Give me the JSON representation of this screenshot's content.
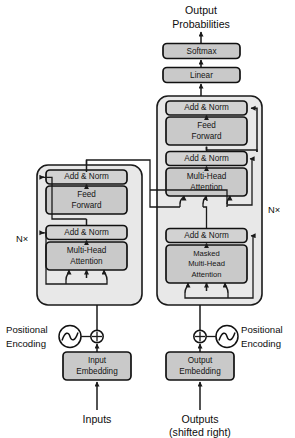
{
  "figure": {
    "top_label_line1": "Output",
    "top_label_line2": "Probabilities"
  },
  "output_head": {
    "softmax": "Softmax",
    "linear": "Linear"
  },
  "encoder": {
    "repeat_label": "N×",
    "blocks": [
      {
        "name": "add-norm-upper",
        "label": "Add & Norm"
      },
      {
        "name": "feed-forward",
        "label_line1": "Feed",
        "label_line2": "Forward"
      },
      {
        "name": "add-norm-lower",
        "label": "Add & Norm"
      },
      {
        "name": "multi-head-attention",
        "label_line1": "Multi-Head",
        "label_line2": "Attention"
      }
    ],
    "embedding_line1": "Input",
    "embedding_line2": "Embedding",
    "positional_line1": "Positional",
    "positional_line2": "Encoding",
    "input_label": "Inputs",
    "add_symbol": "⊕"
  },
  "decoder": {
    "repeat_label": "N×",
    "blocks": [
      {
        "name": "add-norm-top",
        "label": "Add & Norm"
      },
      {
        "name": "feed-forward",
        "label_line1": "Feed",
        "label_line2": "Forward"
      },
      {
        "name": "add-norm-middle",
        "label": "Add & Norm"
      },
      {
        "name": "multi-head-attention",
        "label_line1": "Multi-Head",
        "label_line2": "Attention"
      },
      {
        "name": "add-norm-bottom",
        "label": "Add & Norm"
      },
      {
        "name": "masked-multi-head-attention",
        "label_line1": "Masked",
        "label_line2": "Multi-Head",
        "label_line3": "Attention"
      }
    ],
    "embedding_line1": "Output",
    "embedding_line2": "Embedding",
    "positional_line1": "Positional",
    "positional_line2": "Encoding",
    "input_line1": "Outputs",
    "input_line2": "(shifted right)",
    "add_symbol": "⊕"
  },
  "colors": {
    "background": "#ffffff",
    "stack_fill": "#e8e8e8",
    "block_fill": "#c9c9c9",
    "norm_fill": "#d2d2d2",
    "stroke": "#111111",
    "text": "#0d0d0d"
  }
}
